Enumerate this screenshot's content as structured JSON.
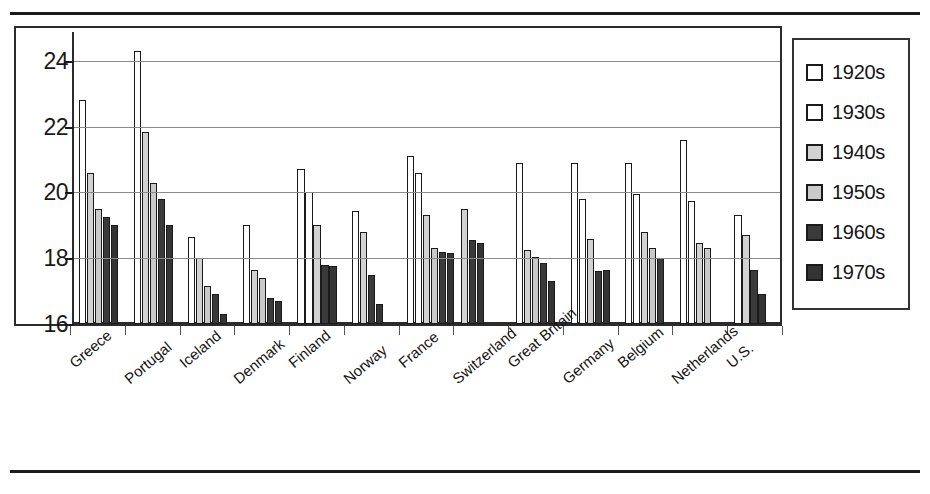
{
  "chart_data": {
    "type": "bar",
    "title": "",
    "subtitle": "",
    "xlabel": "",
    "ylabel": "",
    "ylim": [
      16,
      25
    ],
    "yticks": [
      16,
      18,
      20,
      22,
      24
    ],
    "ytick_labels": [
      "16",
      "18",
      "20",
      "22",
      "24"
    ],
    "grid": true,
    "legend_position": "right",
    "categories": [
      "Greece",
      "Portugal",
      "Iceland",
      "Denmark",
      "Finland",
      "Norway",
      "France",
      "Switzerland",
      "Great Britain",
      "Germany",
      "Belgium",
      "Netherlands",
      "U.S."
    ],
    "series": [
      {
        "name": "1920s",
        "color": "#ffffff",
        "values": [
          22.8,
          24.3,
          null,
          null,
          20.7,
          null,
          21.1,
          null,
          20.9,
          20.9,
          20.9,
          21.6,
          null
        ]
      },
      {
        "name": "1930s",
        "color": "#ffffff",
        "values": [
          null,
          null,
          18.65,
          19.0,
          20.0,
          19.45,
          20.6,
          null,
          null,
          19.8,
          19.95,
          19.75,
          19.3
        ]
      },
      {
        "name": "1940s",
        "color": "#d2d2d2",
        "values": [
          20.6,
          21.85,
          18.0,
          17.65,
          19.0,
          18.8,
          19.3,
          19.5,
          18.25,
          18.6,
          18.8,
          18.45,
          18.7
        ]
      },
      {
        "name": "1950s",
        "color": "#c9c9c9",
        "values": [
          19.5,
          20.3,
          17.15,
          17.4,
          null,
          null,
          18.3,
          null,
          18.05,
          null,
          18.3,
          18.3,
          null
        ]
      },
      {
        "name": "1960s",
        "color": "#3a3a3a",
        "values": [
          19.25,
          19.8,
          16.9,
          16.8,
          17.8,
          17.5,
          18.2,
          18.55,
          17.85,
          17.6,
          18.0,
          null,
          17.65
        ]
      },
      {
        "name": "1970s",
        "color": "#343434",
        "values": [
          19.0,
          19.0,
          16.3,
          16.7,
          17.75,
          16.6,
          18.15,
          18.45,
          17.3,
          17.65,
          null,
          null,
          16.9
        ]
      }
    ]
  },
  "legend": {
    "items": [
      {
        "label": "1920s",
        "swatch": "sw-1920s"
      },
      {
        "label": "1930s",
        "swatch": "sw-1930s"
      },
      {
        "label": "1940s",
        "swatch": "sw-1940s"
      },
      {
        "label": "1950s",
        "swatch": "sw-1950s"
      },
      {
        "label": "1960s",
        "swatch": "sw-1960s"
      },
      {
        "label": "1970s",
        "swatch": "sw-1970s"
      }
    ]
  }
}
